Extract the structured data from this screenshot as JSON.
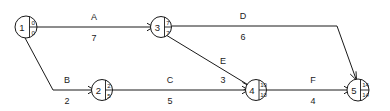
{
  "diagram": {
    "type": "activity-on-arrow-network",
    "nodes": [
      {
        "id": "1",
        "earliest": "0",
        "latest": "0",
        "cx": 26,
        "cy": 27
      },
      {
        "id": "2",
        "id_label": "2",
        "earliest": "2",
        "latest": "5",
        "cx": 102,
        "cy": 90
      },
      {
        "id": "3",
        "earliest": "7",
        "latest": "7",
        "cx": 161,
        "cy": 27
      },
      {
        "id": "4",
        "earliest": "10",
        "latest": "10",
        "cx": 256,
        "cy": 90
      },
      {
        "id": "5",
        "earliest": "14",
        "latest": "14",
        "cx": 358,
        "cy": 90
      }
    ],
    "edges": [
      {
        "name": "A",
        "duration": "7",
        "from": "1",
        "to": "3",
        "label_x": 94,
        "name_y": 20,
        "dur_y": 41
      },
      {
        "name": "D",
        "duration": "6",
        "from": "3",
        "to": "5",
        "label_x": 243,
        "name_y": 19,
        "dur_y": 40
      },
      {
        "name": "E",
        "duration": "3",
        "from": "3",
        "to": "4",
        "label_x": 223,
        "name_y": 64,
        "dur_y": 83
      },
      {
        "name": "B",
        "duration": "2",
        "from": "1",
        "to": "2",
        "label_x": 67,
        "name_y": 83,
        "dur_y": 104
      },
      {
        "name": "C",
        "duration": "5",
        "from": "2",
        "to": "4",
        "label_x": 170,
        "name_y": 83,
        "dur_y": 104
      },
      {
        "name": "F",
        "duration": "4",
        "from": "4",
        "to": "5",
        "label_x": 313,
        "name_y": 83,
        "dur_y": 104
      }
    ],
    "colors": {
      "stroke": "#1a1a1a",
      "background": "#ffffff"
    }
  }
}
